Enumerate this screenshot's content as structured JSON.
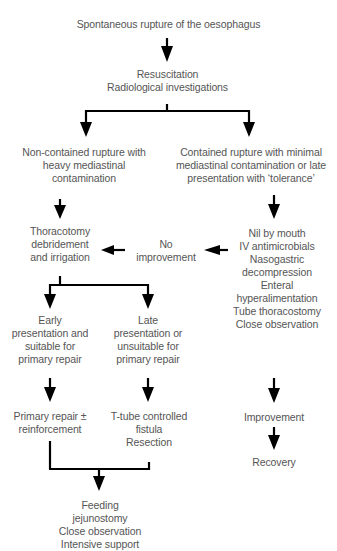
{
  "diagram": {
    "type": "flowchart",
    "nodes": {
      "start": "Spontaneous rupture of the oesophagus",
      "resus": "Resuscitation\nRadiological investigations",
      "noncontained": "Non-contained rupture with\nheavy mediastinal\ncontamination",
      "contained": "Contained rupture with minimal\nmediastinal contamination or late\npresentation with ‘tolerance’",
      "thoracotomy": "Thoracotomy\ndebridement\nand irrigation",
      "noimprove": "No\nimprovement",
      "conservative": "Nil by mouth\nIV antimicrobials\nNasogastric\ndecompression\nEnteral\nhyperalimentation\nTube thoracostomy\nClose observation",
      "early": "Early\npresentation and\nsuitable for\nprimary repair",
      "late": "Late\npresentation or\nunsuitable for\nprimary repair",
      "primary": "Primary repair ±\nreinforcement",
      "ttube": "T-tube controlled\nfistula\nResection",
      "improvement": "Improvement",
      "recovery": "Recovery",
      "feeding": "Feeding\njejunostomy\nClose observation\nIntensive support"
    },
    "edges": [
      [
        "start",
        "resus"
      ],
      [
        "resus",
        "noncontained"
      ],
      [
        "resus",
        "contained"
      ],
      [
        "noncontained",
        "thoracotomy"
      ],
      [
        "contained",
        "conservative"
      ],
      [
        "conservative",
        "noimprove"
      ],
      [
        "noimprove",
        "thoracotomy"
      ],
      [
        "thoracotomy",
        "early"
      ],
      [
        "thoracotomy",
        "late"
      ],
      [
        "early",
        "primary"
      ],
      [
        "late",
        "ttube"
      ],
      [
        "conservative",
        "improvement"
      ],
      [
        "improvement",
        "recovery"
      ],
      [
        "primary",
        "feeding"
      ],
      [
        "ttube",
        "feeding"
      ]
    ],
    "line_color": "#000000",
    "text_color": "#555555"
  }
}
